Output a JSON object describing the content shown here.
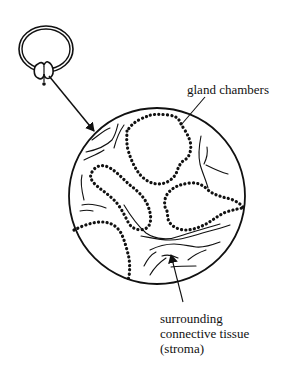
{
  "diagram": {
    "type": "histology-illustration",
    "labels": {
      "gland_chambers": "gland chambers",
      "stroma_line1": "surrounding",
      "stroma_line2": "connective tissue",
      "stroma_line3": "(stroma)"
    },
    "colors": {
      "ink": "#111111",
      "background": "#ffffff"
    }
  }
}
